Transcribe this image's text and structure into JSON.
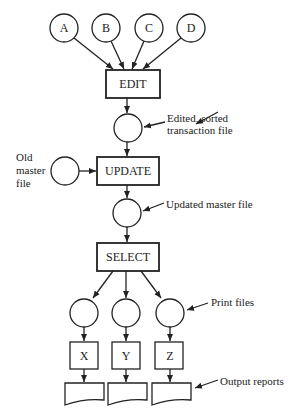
{
  "diagram": {
    "input_files": [
      "A",
      "B",
      "C",
      "D"
    ],
    "processes": {
      "edit": "EDIT",
      "update": "UPDATE",
      "select": "SELECT",
      "outputs": [
        "X",
        "Y",
        "Z"
      ]
    },
    "annotations": {
      "sorted_line1": "Edited, sorted",
      "sorted_line2": "transaction file",
      "old_master_line1": "Old",
      "old_master_line2": "master",
      "old_master_line3": "file",
      "updated_master": "Updated master file",
      "print_files": "Print files",
      "output_reports": "Output reports"
    },
    "colors": {
      "stroke": "#222222",
      "background": "#ffffff"
    }
  }
}
